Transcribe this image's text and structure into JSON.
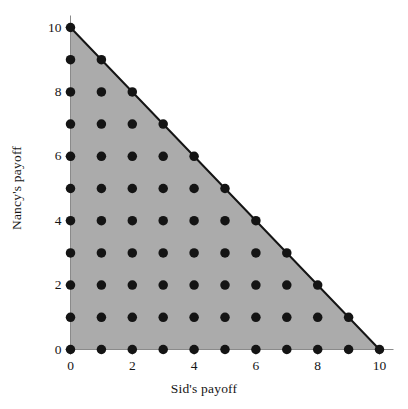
{
  "figure": {
    "background_color": "#ffffff",
    "region_fill_color": "#ababab",
    "line_color": "#151515",
    "point_color": "#141414",
    "axis_color": "#8a8a8a"
  },
  "axes": {
    "x_title": "Sid's payoff",
    "y_title": "Nancy's payoff",
    "x_tick_labels": [
      "0",
      "2",
      "4",
      "6",
      "8",
      "10"
    ],
    "y_tick_labels": [
      "0",
      "2",
      "4",
      "6",
      "8",
      "10"
    ]
  },
  "chart_data": {
    "type": "scatter",
    "title": "",
    "xlabel": "Sid's payoff",
    "ylabel": "Nancy's payoff",
    "xlim": [
      0,
      10
    ],
    "ylim": [
      0,
      10
    ],
    "grid": false,
    "legend": "none",
    "x_ticks": [
      0,
      1,
      2,
      3,
      4,
      5,
      6,
      7,
      8,
      9,
      10
    ],
    "y_ticks": [
      0,
      1,
      2,
      3,
      4,
      5,
      6,
      7,
      8,
      9,
      10
    ],
    "x_tick_labels_shown": [
      0,
      2,
      4,
      6,
      8,
      10
    ],
    "y_tick_labels_shown": [
      0,
      2,
      4,
      6,
      8,
      10
    ],
    "minor_ticks_every": 1,
    "annotations": [],
    "shaded_region": {
      "name": "feasible-payoff-set",
      "description": "Triangle of feasible payoff pairs satisfying x + y <= 10, x >= 0, y >= 0",
      "fill": "#ababab",
      "boundary_line": "hypotenuse from (0,10) to (10,0)",
      "vertices": [
        [
          0,
          0
        ],
        [
          10,
          0
        ],
        [
          0,
          10
        ]
      ]
    },
    "series": [
      {
        "name": "integer payoff allocations",
        "marker": "filled-circle",
        "color": "#141414",
        "marker_size_px": 9.5,
        "constraint": "x + y <= 10 with x, y integers in [0,10]",
        "count": 66,
        "points": [
          [
            0,
            0
          ],
          [
            1,
            0
          ],
          [
            2,
            0
          ],
          [
            3,
            0
          ],
          [
            4,
            0
          ],
          [
            5,
            0
          ],
          [
            6,
            0
          ],
          [
            7,
            0
          ],
          [
            8,
            0
          ],
          [
            9,
            0
          ],
          [
            10,
            0
          ],
          [
            0,
            1
          ],
          [
            1,
            1
          ],
          [
            2,
            1
          ],
          [
            3,
            1
          ],
          [
            4,
            1
          ],
          [
            5,
            1
          ],
          [
            6,
            1
          ],
          [
            7,
            1
          ],
          [
            8,
            1
          ],
          [
            9,
            1
          ],
          [
            0,
            2
          ],
          [
            1,
            2
          ],
          [
            2,
            2
          ],
          [
            3,
            2
          ],
          [
            4,
            2
          ],
          [
            5,
            2
          ],
          [
            6,
            2
          ],
          [
            7,
            2
          ],
          [
            8,
            2
          ],
          [
            0,
            3
          ],
          [
            1,
            3
          ],
          [
            2,
            3
          ],
          [
            3,
            3
          ],
          [
            4,
            3
          ],
          [
            5,
            3
          ],
          [
            6,
            3
          ],
          [
            7,
            3
          ],
          [
            0,
            4
          ],
          [
            1,
            4
          ],
          [
            2,
            4
          ],
          [
            3,
            4
          ],
          [
            4,
            4
          ],
          [
            5,
            4
          ],
          [
            6,
            4
          ],
          [
            0,
            5
          ],
          [
            1,
            5
          ],
          [
            2,
            5
          ],
          [
            3,
            5
          ],
          [
            4,
            5
          ],
          [
            5,
            5
          ],
          [
            0,
            6
          ],
          [
            1,
            6
          ],
          [
            2,
            6
          ],
          [
            3,
            6
          ],
          [
            4,
            6
          ],
          [
            0,
            7
          ],
          [
            1,
            7
          ],
          [
            2,
            7
          ],
          [
            3,
            7
          ],
          [
            0,
            8
          ],
          [
            1,
            8
          ],
          [
            2,
            8
          ],
          [
            0,
            9
          ],
          [
            1,
            9
          ],
          [
            0,
            10
          ]
        ]
      }
    ]
  }
}
